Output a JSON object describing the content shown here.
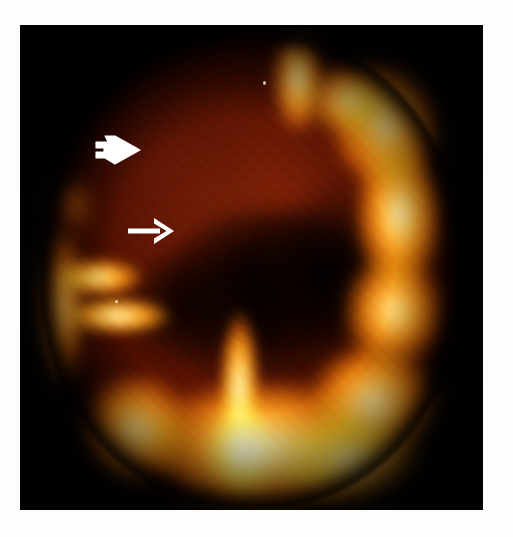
{
  "figure": {
    "kind": "medical-brain-scan",
    "modality": "SPECT / nuclear-medicine perfusion brain scan",
    "plane": "axial",
    "colormap": "hot-iron (black → red → orange → yellow → white)",
    "background_color": "#ffffff",
    "canvas_color": "#050202",
    "caption": ""
  },
  "scan": {
    "frame": {
      "left": 20,
      "top": 25,
      "width": 463,
      "height": 485
    },
    "palette": {
      "background": "#050202",
      "cold_red": "#4a0f02",
      "mid_red": "#6e1c06",
      "orange": "#ef8c13",
      "bright_orange": "#ffbd46",
      "yellow": "#ffd568",
      "pale_yellow": "#fff6cc",
      "annotation_white": "#ffffff"
    },
    "regions": [
      {
        "name": "left-frontal-hypoperfusion",
        "label": "Reduced tracer uptake – left frontal region",
        "intensity": "low",
        "color": "#6e1c06"
      },
      {
        "name": "right-cortical-rim",
        "label": "Preserved cortical uptake – right hemisphere",
        "intensity": "high",
        "color": "#ffc24a"
      },
      {
        "name": "left-lateral-bands",
        "label": "Preserved cortical uptake – left lateral cortex",
        "intensity": "high",
        "color": "#ffcd60"
      },
      {
        "name": "occipital-posterior",
        "label": "High uptake – posterior / occipital cortex",
        "intensity": "high",
        "color": "#ffd568"
      },
      {
        "name": "central-deep-structures",
        "label": "Low uptake – deep white matter / ventricles",
        "intensity": "very low",
        "color": "#060100"
      },
      {
        "name": "midline-flame",
        "label": "Midline posterior high uptake",
        "intensity": "high",
        "color": "#fff7d4"
      }
    ]
  },
  "annotations": [
    {
      "id": "open-arrow",
      "name": "open-arrow-annotation",
      "style": "outlined hollow arrow pointing right",
      "color": "#ffffff",
      "points_to": "left-frontal-hypoperfusion",
      "x": 72,
      "y": 108,
      "width": 52,
      "height": 34
    },
    {
      "id": "solid-arrow",
      "name": "solid-arrow-annotation",
      "style": "solid line arrow pointing right",
      "color": "#ffffff",
      "points_to": "left-frontal-hypoperfusion",
      "x": 106,
      "y": 191,
      "width": 50,
      "height": 30
    }
  ]
}
